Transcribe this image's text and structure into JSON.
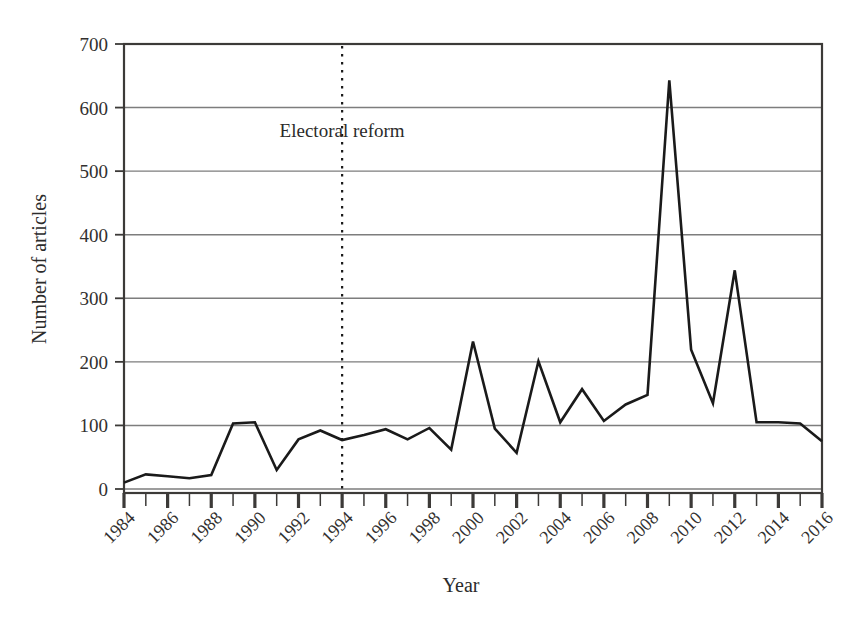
{
  "chart_data": {
    "type": "line",
    "title": "",
    "xlabel": "Year",
    "ylabel": "Number of articles",
    "xlim": [
      1984,
      2016
    ],
    "ylim": [
      0,
      700
    ],
    "grid": "horizontal",
    "legend": "none",
    "x": [
      1984,
      1985,
      1986,
      1987,
      1988,
      1989,
      1990,
      1991,
      1992,
      1993,
      1994,
      1995,
      1996,
      1997,
      1998,
      1999,
      2000,
      2001,
      2002,
      2003,
      2004,
      2005,
      2006,
      2007,
      2008,
      2009,
      2010,
      2011,
      2012,
      2013,
      2014,
      2015,
      2016
    ],
    "values": [
      10,
      23,
      20,
      17,
      22,
      103,
      105,
      30,
      78,
      92,
      77,
      85,
      94,
      78,
      96,
      62,
      232,
      95,
      57,
      201,
      105,
      157,
      107,
      133,
      148,
      643,
      219,
      135,
      344,
      105,
      105,
      103,
      75
    ],
    "series": [
      {
        "name": "Number of articles",
        "color": "#1a1a1a",
        "values": [
          10,
          23,
          20,
          17,
          22,
          103,
          105,
          30,
          78,
          92,
          77,
          85,
          94,
          78,
          96,
          62,
          232,
          95,
          57,
          201,
          105,
          157,
          107,
          133,
          148,
          643,
          219,
          135,
          344,
          105,
          105,
          103,
          75
        ]
      }
    ],
    "y_ticks": [
      0,
      100,
      200,
      300,
      400,
      500,
      600,
      700
    ],
    "y_tick_labels": [
      "0",
      "100",
      "200",
      "300",
      "400",
      "500",
      "600",
      "700"
    ],
    "x_major_ticks": [
      1984,
      1986,
      1988,
      1990,
      1992,
      1994,
      1996,
      1998,
      2000,
      2002,
      2004,
      2006,
      2008,
      2010,
      2012,
      2014,
      2016
    ],
    "x_major_tick_labels": [
      "1984",
      "1986",
      "1988",
      "1990",
      "1992",
      "1994",
      "1996",
      "1998",
      "2000",
      "2002",
      "2004",
      "2006",
      "2008",
      "2010",
      "2012",
      "2014",
      "2016"
    ],
    "x_minor_ticks": [
      1985,
      1987,
      1989,
      1991,
      1993,
      1995,
      1997,
      1999,
      2001,
      2003,
      2005,
      2007,
      2009,
      2011,
      2013,
      2015
    ],
    "annotations": [
      {
        "text": "Electoral reform",
        "x": 1994,
        "style": "vertical-dotted-line",
        "line_color": "#1a1a1a",
        "label_y_value": 553
      }
    ],
    "colors": {
      "line": "#1a1a1a",
      "grid": "#7d7d7d",
      "frame": "#3c3a38",
      "text": "#2b2b2b",
      "background": "#ffffff"
    }
  },
  "axes": {
    "y_title": "Number of articles",
    "x_title": "Year"
  }
}
